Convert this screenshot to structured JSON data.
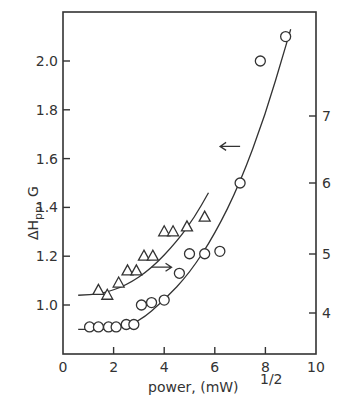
{
  "chart_data": {
    "type": "scatter",
    "title": "",
    "xlabel": "power, (mW)",
    "xlabel_superscript": "1/2",
    "ylabel": "ΔHpp , G",
    "ylabel_main": "ΔH",
    "ylabel_sub": "pp",
    "ylabel_unit": ", G",
    "xlim": [
      0,
      10
    ],
    "ylim_left": [
      0.8,
      2.2
    ],
    "ylim_right_ticks": [
      4,
      5,
      6,
      7
    ],
    "x_ticks": [
      0,
      2,
      4,
      6,
      8,
      10
    ],
    "x_tick_labels": [
      "0",
      "2",
      "4",
      "6",
      "8",
      "10"
    ],
    "y_left_ticks": [
      1.0,
      1.2,
      1.4,
      1.6,
      1.8,
      2.0
    ],
    "y_left_tick_labels": [
      "1.0",
      "1.2",
      "1.4",
      "1.6",
      "1.8",
      "2.0"
    ],
    "y_right_tick_labels": [
      "4",
      "5",
      "6",
      "7"
    ],
    "grid": false,
    "legend": "none (arrows indicate axis: circles → left axis, triangles → right axis)",
    "series": [
      {
        "name": "circles (left axis, ΔHpp G)",
        "marker": "circle",
        "axis": "left",
        "x": [
          1.05,
          1.4,
          1.8,
          2.1,
          2.5,
          2.8,
          3.1,
          3.5,
          4.0,
          4.6,
          5.0,
          5.6,
          6.2,
          7.0,
          7.8,
          8.8
        ],
        "y": [
          0.91,
          0.91,
          0.91,
          0.91,
          0.92,
          0.92,
          1.0,
          1.01,
          1.02,
          1.13,
          1.21,
          1.21,
          1.22,
          1.5,
          2.0,
          2.1
        ]
      },
      {
        "name": "triangles (right axis)",
        "marker": "triangle",
        "axis": "right",
        "x": [
          1.4,
          1.75,
          2.2,
          2.55,
          2.9,
          3.2,
          3.55,
          4.0,
          4.35,
          4.9,
          5.6
        ],
        "y_left_equiv": [
          1.06,
          1.04,
          1.09,
          1.14,
          1.14,
          1.2,
          1.2,
          1.3,
          1.3,
          1.32,
          1.36
        ]
      }
    ],
    "fit_curves": [
      {
        "name": "circle fit",
        "x": [
          0.6,
          2.0,
          3.0,
          4.0,
          5.0,
          6.0,
          7.0,
          8.0,
          8.8,
          9.0
        ],
        "y": [
          0.9,
          0.9,
          0.93,
          1.02,
          1.13,
          1.29,
          1.5,
          1.78,
          2.06,
          2.13
        ]
      },
      {
        "name": "triangle fit",
        "x": [
          0.6,
          1.5,
          2.5,
          3.5,
          4.5,
          5.2,
          5.75
        ],
        "y": [
          1.04,
          1.045,
          1.08,
          1.15,
          1.26,
          1.36,
          1.46
        ]
      }
    ],
    "annotations": [
      {
        "type": "arrow",
        "direction": "left",
        "at": {
          "x": 7.0,
          "y": 1.65
        },
        "meaning": "circles read on left axis"
      },
      {
        "type": "arrow",
        "direction": "right",
        "at": {
          "x": 3.5,
          "y": 1.155
        },
        "meaning": "triangles read on right axis"
      }
    ]
  }
}
